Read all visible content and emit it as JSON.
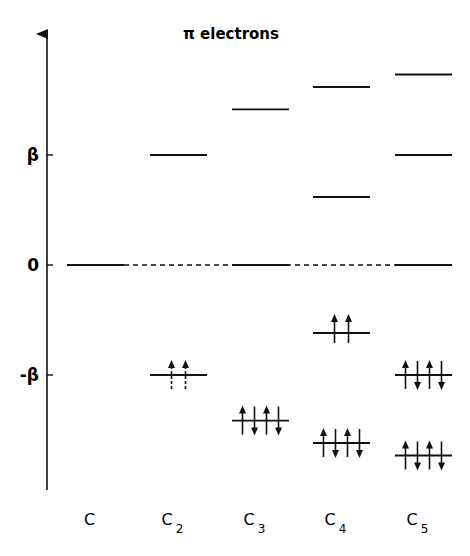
{
  "title": "π electrons",
  "axis": {
    "y_labels": [
      {
        "label": "β",
        "value": 1
      },
      {
        "label": "0",
        "value": 0
      },
      {
        "label": "-β",
        "value": -1
      }
    ]
  },
  "zero_line_style": "dashed",
  "colors": {
    "ink": "#111111",
    "background": "#ffffff"
  },
  "species": [
    {
      "name": "C",
      "subscript": "",
      "levels": [
        {
          "energy_beta": 0,
          "electrons": 0
        }
      ]
    },
    {
      "name": "C",
      "subscript": "2",
      "levels": [
        {
          "energy_beta": 1,
          "electrons": 0
        },
        {
          "energy_beta": -1,
          "electrons": 2,
          "spins": [
            "up",
            "up"
          ],
          "arrow_style": "dashed"
        }
      ]
    },
    {
      "name": "C",
      "subscript": "3",
      "levels": [
        {
          "energy_beta": 1.414,
          "electrons": 0
        },
        {
          "energy_beta": 0,
          "electrons": 0
        },
        {
          "energy_beta": -1.414,
          "electrons": 4,
          "spins": [
            "up",
            "down",
            "up",
            "down"
          ]
        }
      ]
    },
    {
      "name": "C",
      "subscript": "4",
      "levels": [
        {
          "energy_beta": 1.618,
          "electrons": 0
        },
        {
          "energy_beta": 0.618,
          "electrons": 0
        },
        {
          "energy_beta": -0.618,
          "electrons": 2,
          "spins": [
            "up",
            "up"
          ]
        },
        {
          "energy_beta": -1.618,
          "electrons": 4,
          "spins": [
            "up",
            "down",
            "up",
            "down"
          ]
        }
      ]
    },
    {
      "name": "C",
      "subscript": "5",
      "levels": [
        {
          "energy_beta": 1.732,
          "electrons": 0
        },
        {
          "energy_beta": 1,
          "electrons": 0
        },
        {
          "energy_beta": 0,
          "electrons": 0
        },
        {
          "energy_beta": -1,
          "electrons": 4,
          "spins": [
            "up",
            "down",
            "up",
            "down"
          ]
        },
        {
          "energy_beta": -1.732,
          "electrons": 4,
          "spins": [
            "up",
            "down",
            "up",
            "down"
          ]
        }
      ]
    }
  ]
}
